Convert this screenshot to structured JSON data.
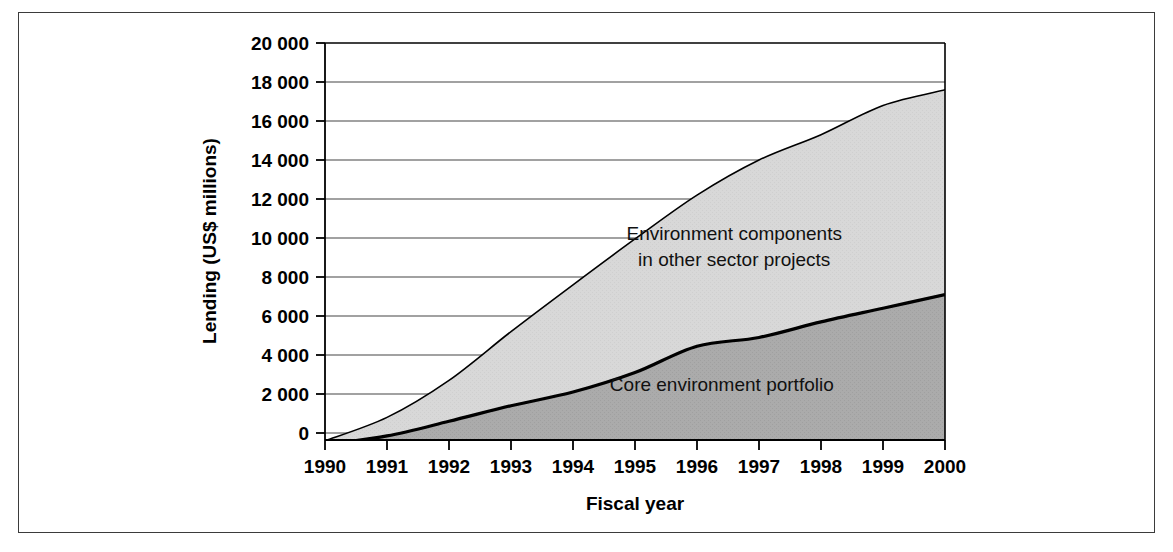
{
  "figure": {
    "background": "#ffffff",
    "frame_color": "#3b3b3b"
  },
  "chart_data": {
    "type": "area",
    "stacked": true,
    "title": "",
    "xlabel": "Fiscal year",
    "ylabel": "Lending (US$ millions)",
    "x": [
      1990,
      1991,
      1992,
      1993,
      1994,
      1995,
      1996,
      1997,
      1998,
      1999,
      2000
    ],
    "xtick_labels": [
      "1990",
      "1991",
      "1992",
      "1993",
      "1994",
      "1995",
      "1996",
      "1997",
      "1998",
      "1999",
      "2000"
    ],
    "ytick_labels": [
      "0",
      "2 000",
      "4 000",
      "6 000",
      "8 000",
      "10 000",
      "12 000",
      "14 000",
      "16 000",
      "18 000",
      "20 000"
    ],
    "yticks": [
      0,
      2000,
      4000,
      6000,
      8000,
      10000,
      12000,
      14000,
      16000,
      18000,
      20000
    ],
    "ylim": [
      -700,
      20000
    ],
    "xlim": [
      1990,
      2000
    ],
    "grid": "horizontal",
    "legend": "in-plot annotations",
    "series": [
      {
        "name": "Core environment portfolio",
        "color": "#a8a8a8",
        "edge_color": "#000000",
        "values": [
          -600,
          -150,
          600,
          1400,
          2100,
          3100,
          4450,
          4900,
          5700,
          6400,
          7100
        ]
      },
      {
        "name": "Environment components in other sector projects",
        "color": "#d6d6d6",
        "edge_color": "#000000",
        "values": [
          200,
          950,
          2100,
          3800,
          5500,
          6850,
          7750,
          9100,
          9600,
          10400,
          10500
        ]
      }
    ],
    "cumulative_totals": [
      -400,
      800,
      2700,
      5200,
      7600,
      9950,
      12200,
      14000,
      15300,
      16800,
      17600
    ],
    "annotations": [
      {
        "name": "upper-band-label",
        "lines": [
          "Environment components",
          "in other sector projects"
        ],
        "x": 1996.6,
        "y": 9900
      },
      {
        "name": "lower-band-label",
        "lines": [
          "Core environment portfolio"
        ],
        "x": 1996.4,
        "y": 2150
      }
    ]
  }
}
